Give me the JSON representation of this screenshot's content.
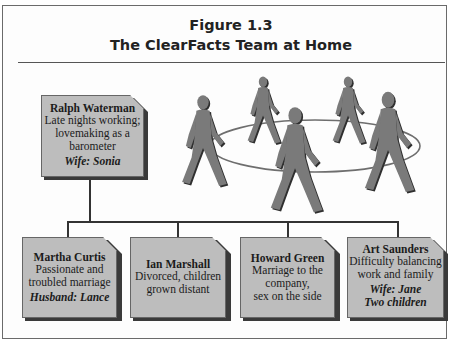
{
  "figure": {
    "number": "Figure 1.3",
    "title": "The ClearFacts Team at Home"
  },
  "colors": {
    "box_fill": "#bdbdbd",
    "box_shadow": "#3a3a3a",
    "figure_fill": "#7a7a7a",
    "connector": "#333333"
  },
  "top_member": {
    "name": "Ralph Waterman",
    "desc_lines": [
      "Late nights working;",
      "lovemaking as a",
      "barometer"
    ],
    "spouse": "Wife: Sonia"
  },
  "members": [
    {
      "name": "Martha Curtis",
      "desc_lines": [
        "Passionate and",
        "troubled marriage"
      ],
      "spouse_lines": [
        "Husband: Lance"
      ]
    },
    {
      "name": "Ian Marshall",
      "desc_lines": [
        "Divorced, children",
        "grown distant"
      ],
      "spouse_lines": []
    },
    {
      "name": "Howard Green",
      "desc_lines": [
        "Marriage to the",
        "company,",
        "sex on the side"
      ],
      "spouse_lines": []
    },
    {
      "name": "Art Saunders",
      "desc_lines": [
        "Difficulty balancing",
        "work and family"
      ],
      "spouse_lines": [
        "Wife: Jane",
        "Two children"
      ]
    }
  ],
  "illustration": {
    "icon": "walking-people-circle-icon",
    "figure_count": 5
  }
}
